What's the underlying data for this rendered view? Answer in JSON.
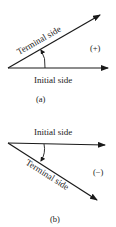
{
  "figure_a": {
    "terminal_label": "Terminal side",
    "initial_label": "Initial side",
    "sign": "(+)",
    "caption": "(a)"
  },
  "figure_b": {
    "initial_label": "Initial side",
    "terminal_label": "Terminal side",
    "sign": "(−)",
    "caption": "(b)"
  },
  "colors": {
    "stroke": "#1a1a1a",
    "background": "#ffffff"
  }
}
